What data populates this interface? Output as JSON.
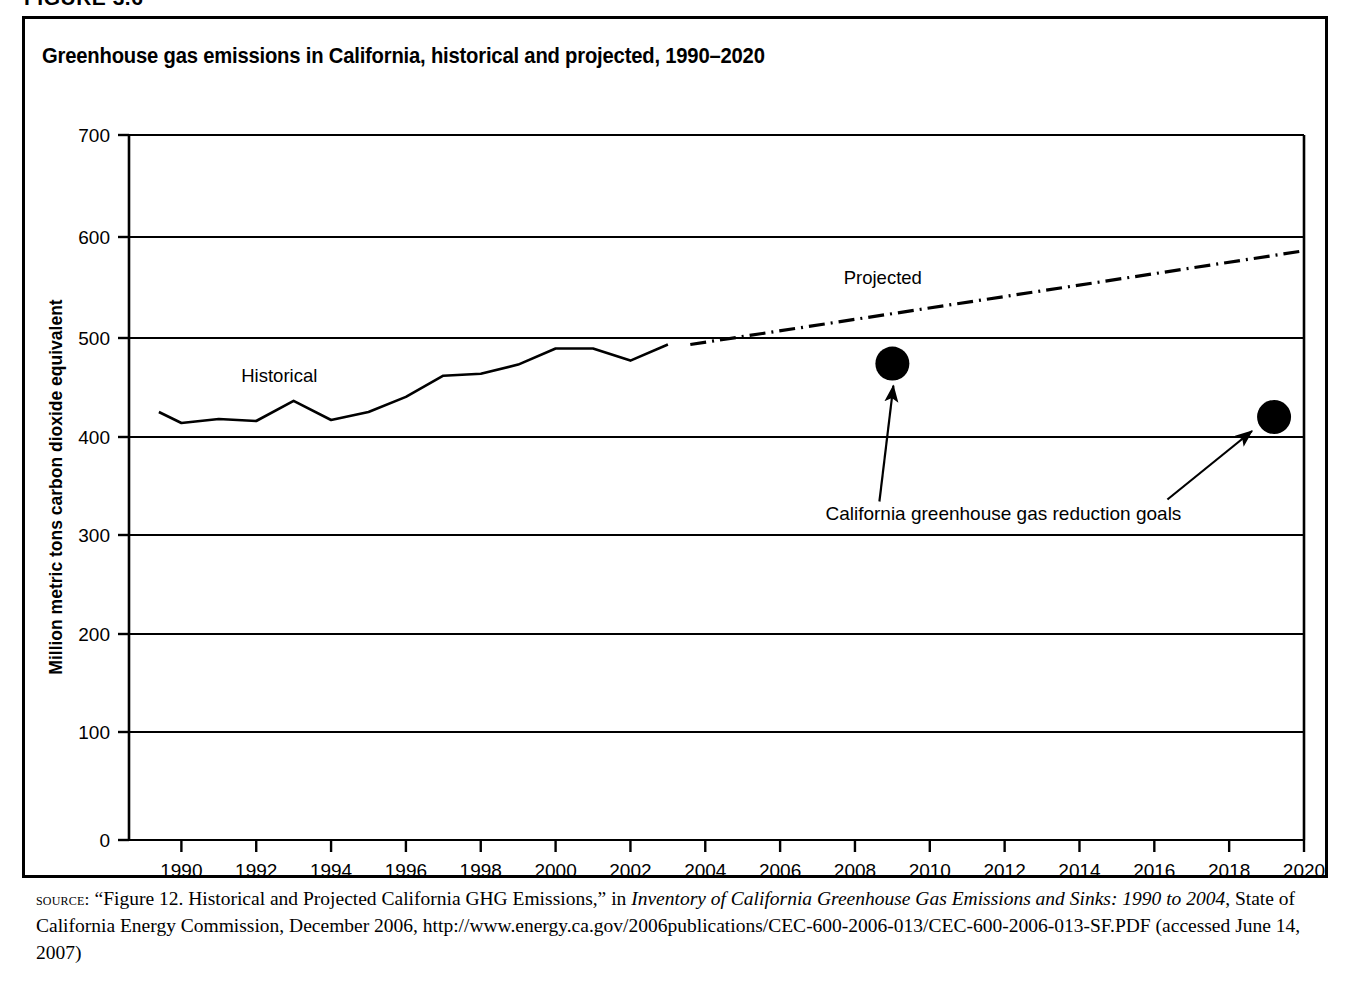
{
  "figure": {
    "heading": "FIGURE 3.6",
    "title": "Greenhouse gas emissions in California, historical and projected, 1990–2020"
  },
  "source": {
    "keyword": "source:",
    "text_part1": " “Figure 12. Historical and Projected California GHG Emissions,” in ",
    "italic_title": "Inventory of California Greenhouse Gas Emissions and Sinks: 1990 to 2004",
    "text_part2": ", State of California Energy Commission, December 2006, http://www.energy.ca.gov/2006publications/CEC-600-2006-013/CEC-600-2006-013-SF.PDF (accessed June 14, 2007)"
  },
  "chart_data": {
    "type": "line",
    "title": "Greenhouse gas emissions in California, historical and projected, 1990–2020",
    "xlabel": "",
    "ylabel": "Million metric tons carbon dioxide equivalent",
    "xlim": [
      1988.6,
      2020
    ],
    "ylim": [
      0,
      700
    ],
    "ytick_step": 100,
    "xtick_step": 2,
    "grid": "horizontal",
    "legend": "none",
    "xticks": [
      "1990",
      "1992",
      "1994",
      "1996",
      "1998",
      "2000",
      "2002",
      "2004",
      "2006",
      "2008",
      "2010",
      "2012",
      "2014",
      "2016",
      "2018",
      "2020"
    ],
    "yticks": [
      "0",
      "100",
      "200",
      "300",
      "400",
      "500",
      "600",
      "700"
    ],
    "series": [
      {
        "name": "Historical",
        "style": "solid",
        "label_text": "Historical",
        "label_x": 1991.6,
        "label_y": 455,
        "x": [
          1989.4,
          1990,
          1991,
          1992,
          1993,
          1994,
          1995,
          1996,
          1997,
          1998,
          1999,
          2000,
          2001,
          2002,
          2003
        ],
        "values": [
          425,
          414,
          418,
          416,
          436,
          417,
          425,
          440,
          461,
          463,
          472,
          488,
          488,
          476,
          492
        ]
      },
      {
        "name": "Projected",
        "style": "dash-dot",
        "label_text": "Projected",
        "label_x": 2007.7,
        "label_y": 552,
        "x": [
          2003.6,
          2020
        ],
        "values": [
          492,
          585
        ]
      }
    ],
    "points": [
      {
        "name": "California greenhouse gas reduction goal 2010",
        "x": 2009,
        "y": 473
      },
      {
        "name": "California greenhouse gas reduction goal 2020",
        "x": 2019.2,
        "y": 420
      }
    ],
    "annotations": [
      {
        "text": "California greenhouse gas reduction goals",
        "x": 2008.6,
        "y": 350
      }
    ]
  }
}
